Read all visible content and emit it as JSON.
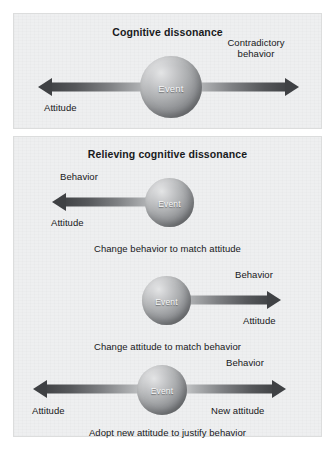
{
  "figure": {
    "background_color": "#ffffff",
    "panel_color": "#eeeff0",
    "arrow_dark": "#3f4144",
    "sphere_label": "Event"
  },
  "panels": [
    {
      "id": "cognitive-dissonance",
      "title": "Cognitive dissonance",
      "diagrams": [
        {
          "id": "dissonance-conflict",
          "sphere_label": "Event",
          "arrows": [
            {
              "direction": "left",
              "label": "Attitude"
            },
            {
              "direction": "right",
              "label": "Contradictory behavior"
            }
          ],
          "caption": ""
        }
      ]
    },
    {
      "id": "relieving-cognitive-dissonance",
      "title": "Relieving cognitive dissonance",
      "diagrams": [
        {
          "id": "change-behavior",
          "sphere_label": "Event",
          "arrows": [
            {
              "direction": "left",
              "label_above": "Behavior",
              "label_below": "Attitude"
            }
          ],
          "caption": "Change behavior to match attitude"
        },
        {
          "id": "change-attitude",
          "sphere_label": "Event",
          "arrows": [
            {
              "direction": "right",
              "label_above": "Behavior",
              "label_below": "Attitude"
            }
          ],
          "caption": "Change attitude to match behavior"
        },
        {
          "id": "adopt-new-attitude",
          "sphere_label": "Event",
          "arrows": [
            {
              "direction": "left",
              "label_below": "Attitude"
            },
            {
              "direction": "right",
              "label_above": "Behavior",
              "label_below": "New attitude"
            }
          ],
          "caption": "Adopt new attitude to justify behavior"
        }
      ]
    }
  ]
}
